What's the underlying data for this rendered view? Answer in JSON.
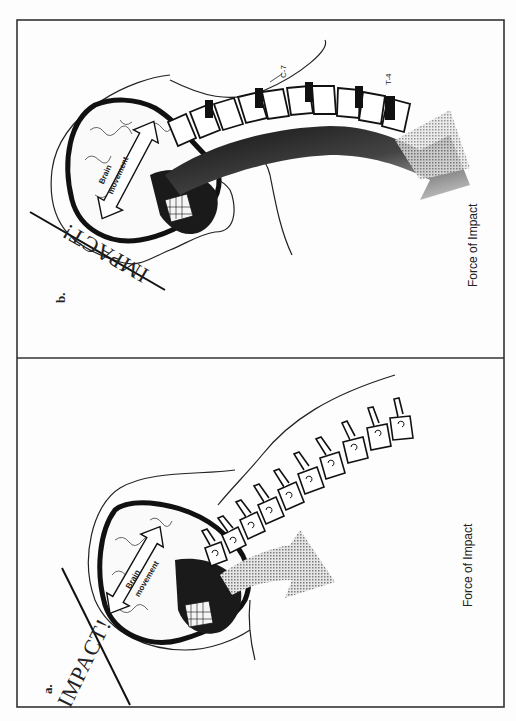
{
  "figure": {
    "orientation": "rotated-90-ccw",
    "frame_color": "#333333",
    "arrow_gray": "#9a9a9a",
    "panels": [
      {
        "id": "a",
        "label": "a.",
        "impact_text": "IMPACT!",
        "brain_arrow_text_line1": "Brain",
        "brain_arrow_text_line2": "movement",
        "force_label": "Force of Impact",
        "description": "Head struck from the front; brain moves inside skull; cervical vertebrae shown separately; gray force arrow below neck"
      },
      {
        "id": "b",
        "label": "b.",
        "impact_text": "IMPACT!",
        "brain_arrow_text_line1": "Brain",
        "brain_arrow_text_line2": "movement",
        "force_label": "Force of Impact",
        "vertebra_labels": [
          "C-7",
          "T-4"
        ],
        "description": "Head struck; dark force path runs along the spine from skull through C-7 to T-4, fading into a gray arrow"
      }
    ]
  }
}
